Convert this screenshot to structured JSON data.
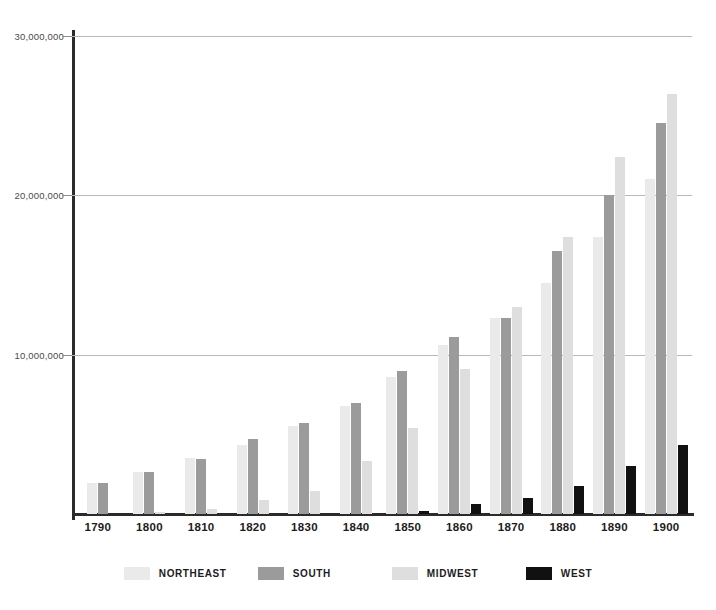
{
  "chart_data": {
    "type": "bar",
    "title": "",
    "subtitle": "",
    "xlabel": "",
    "ylabel": "",
    "ylim": [
      0,
      30000000
    ],
    "grid": true,
    "legend_position": "bottom",
    "categories": [
      "1790",
      "1800",
      "1810",
      "1820",
      "1830",
      "1840",
      "1850",
      "1860",
      "1870",
      "1880",
      "1890",
      "1900"
    ],
    "y_ticks": [
      10000000,
      20000000,
      30000000
    ],
    "y_tick_labels": [
      "10,000,000",
      "20,000,000",
      "30,000,000"
    ],
    "series": [
      {
        "name": "NORTHEAST",
        "color": "#eaeaea",
        "values": [
          1968000,
          2636000,
          3487000,
          4360000,
          5542000,
          6761000,
          8627000,
          10594000,
          12299000,
          14507000,
          17407000,
          21047000
        ]
      },
      {
        "name": "SOUTH",
        "color": "#9b9b9b",
        "values": [
          1961000,
          2622000,
          3461000,
          4679000,
          5708000,
          6950000,
          8983000,
          11133000,
          12288000,
          16517000,
          20028000,
          24524000
        ]
      },
      {
        "name": "MIDWEST",
        "color": "#dedede",
        "values": [
          0,
          51000,
          292000,
          859000,
          1470000,
          3352000,
          5404000,
          9097000,
          12981000,
          17364000,
          22410000,
          26333000
        ]
      },
      {
        "name": "WEST",
        "color": "#111111",
        "values": [
          0,
          0,
          0,
          0,
          0,
          0,
          179000,
          619000,
          991000,
          1768000,
          3027000,
          4309000
        ]
      }
    ]
  },
  "axes": {
    "y_tick_labels": [
      "30,000,000",
      "20,000,000",
      "10,000,000"
    ]
  },
  "legend": {
    "items": [
      {
        "label": "NORTHEAST",
        "key": "ne"
      },
      {
        "label": "SOUTH",
        "key": "so"
      },
      {
        "label": "MIDWEST",
        "key": "mw"
      },
      {
        "label": "WEST",
        "key": "we"
      }
    ]
  }
}
